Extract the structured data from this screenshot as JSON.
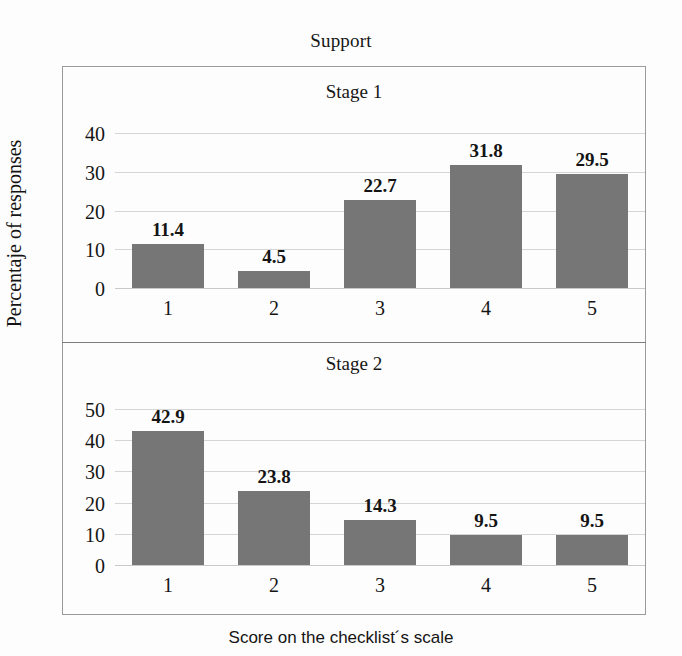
{
  "figure": {
    "super_title": "Support",
    "xlabel": "Score on the checklist´s scale",
    "ylabel": "Percentaje of responses",
    "bar_color": "#767676",
    "grid_color": "#d5d5d5",
    "frame_color": "#9a9a9a",
    "background": "#fdfdfd"
  },
  "chart_data": [
    {
      "type": "bar",
      "title": "Stage 1",
      "xlabel": "Score on the checklist´s scale",
      "ylabel": "Percentaje of responses",
      "categories": [
        "1",
        "2",
        "3",
        "4",
        "5"
      ],
      "values": [
        11.4,
        4.5,
        22.7,
        31.8,
        29.5
      ],
      "value_labels": [
        "11.4",
        "4.5",
        "22.7",
        "31.8",
        "29.5"
      ],
      "yticks": [
        0,
        10,
        20,
        30,
        40
      ],
      "ytick_labels": [
        "0",
        "10",
        "20",
        "30",
        "40"
      ],
      "ylim": [
        0,
        40
      ],
      "grid": true,
      "legend": false
    },
    {
      "type": "bar",
      "title": "Stage 2",
      "xlabel": "Score on the checklist´s scale",
      "ylabel": "Percentaje of responses",
      "categories": [
        "1",
        "2",
        "3",
        "4",
        "5"
      ],
      "values": [
        42.9,
        23.8,
        14.3,
        9.5,
        9.5
      ],
      "value_labels": [
        "42.9",
        "23.8",
        "14.3",
        "9.5",
        "9.5"
      ],
      "yticks": [
        0,
        10,
        20,
        30,
        40,
        50
      ],
      "ytick_labels": [
        "0",
        "10",
        "20",
        "30",
        "40",
        "50"
      ],
      "ylim": [
        0,
        50
      ],
      "grid": true,
      "legend": false
    }
  ]
}
